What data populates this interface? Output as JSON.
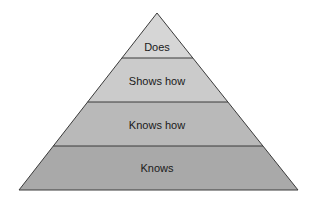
{
  "diagram": {
    "type": "pyramid",
    "levels": [
      {
        "label": "Does",
        "color": "#d6d6d6"
      },
      {
        "label": "Shows how",
        "color": "#cbcbcb"
      },
      {
        "label": "Knows how",
        "color": "#b9b9b9"
      },
      {
        "label": "Knows",
        "color": "#a9a9a9"
      }
    ],
    "outline_color": "#3a3a3a"
  }
}
